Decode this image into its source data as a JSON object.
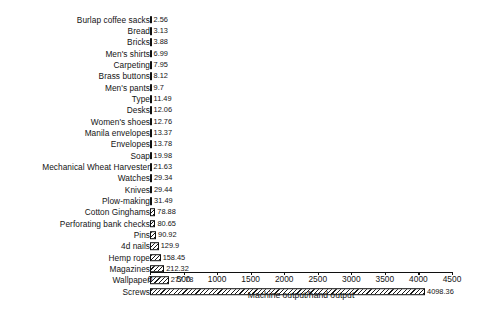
{
  "chart_data": {
    "type": "bar",
    "orientation": "horizontal",
    "title": "",
    "xlabel": "Machine output/hand output",
    "ylabel": "",
    "xlim": [
      0,
      4500
    ],
    "xticks": [
      0,
      500,
      1000,
      1500,
      2000,
      2500,
      3000,
      3500,
      4000,
      4500
    ],
    "grid": false,
    "legend": null,
    "bar_fill": "diagonal-hatch",
    "bar_edge_color": "#101010",
    "categories": [
      "Burlap coffee sacks",
      "Bread",
      "Bricks",
      "Men's shirts",
      "Carpeting",
      "Brass buttons",
      "Men's pants",
      "Type",
      "Desks",
      "Women's shoes",
      "Manila envelopes",
      "Envelopes",
      "Soap",
      "Mechanical Wheat Harvester",
      "Watches",
      "Knives",
      "Plow-making",
      "Cotton Ginghams",
      "Perforating bank checks",
      "Pins",
      "4d nails",
      "Hemp rope",
      "Magazines",
      "Wallpaper",
      "Screws"
    ],
    "values": [
      2.56,
      3.13,
      3.88,
      6.99,
      7.95,
      8.12,
      9.7,
      11.49,
      12.06,
      12.76,
      13.37,
      13.78,
      19.98,
      21.63,
      29.34,
      29.44,
      31.49,
      78.88,
      80.65,
      90.92,
      129.9,
      158.45,
      212.32,
      277.78,
      4098.36
    ],
    "value_labels": [
      "2.56",
      "3.13",
      "3.88",
      "6.99",
      "7.95",
      "8.12",
      "9.7",
      "11.49",
      "12.06",
      "12.76",
      "13.37",
      "13.78",
      "19.98",
      "21.63",
      "29.34",
      "29.44",
      "31.49",
      "78.88",
      "80.65",
      "90.92",
      "129.9",
      "158.45",
      "212.32",
      "277.78",
      "4098.36"
    ]
  },
  "caption": ""
}
